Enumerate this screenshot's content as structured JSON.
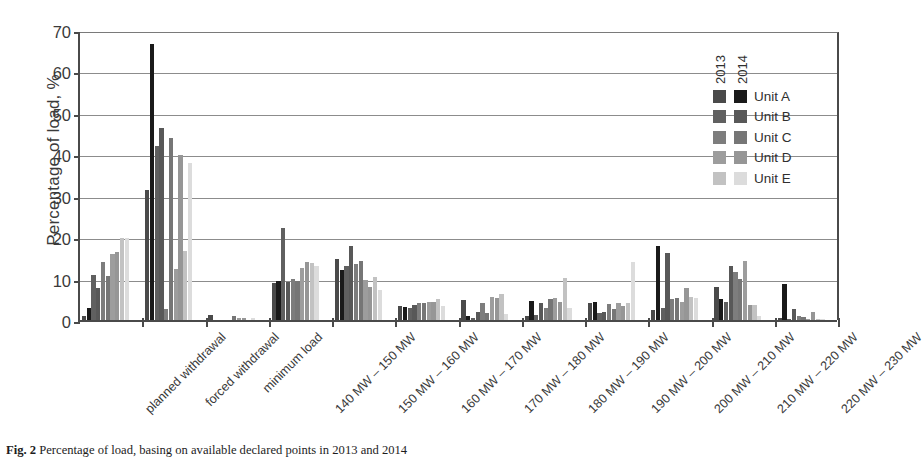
{
  "chart_data": {
    "type": "bar",
    "title": "",
    "xlabel": "",
    "ylabel": "Percentage of load, %",
    "ylim": [
      0,
      70
    ],
    "yticks": [
      0,
      10,
      20,
      30,
      40,
      50,
      60,
      70
    ],
    "grid": true,
    "legend_position": "top-right",
    "legend_groups": [
      "2013",
      "2014"
    ],
    "categories": [
      "planned withdrawal",
      "forced withdrawal",
      "minimum load",
      "140 MW – 150 MW",
      "150 MW – 160 MW",
      "160 MW – 170 MW",
      "170 MW – 180 MW",
      "180 MW – 190 MW",
      "190 MW – 200 MW",
      "200 MW – 210 MW",
      "210 MW – 220 MW",
      "220 MW – 230 MW"
    ],
    "series": [
      {
        "name": "Unit A",
        "year": "2013",
        "color": "#4a4a4a",
        "values": [
          1.0,
          31.5,
          1.1,
          9.0,
          14.8,
          3.5,
          4.8,
          1.0,
          4.2,
          2.3,
          7.9,
          0.4
        ]
      },
      {
        "name": "Unit A",
        "year": "2014",
        "color": "#1a1a1a",
        "values": [
          2.8,
          66.7,
          0.0,
          9.3,
          12.0,
          3.2,
          0.9,
          4.5,
          4.4,
          17.9,
          5.1,
          8.7
        ]
      },
      {
        "name": "Unit B",
        "year": "2013",
        "color": "#606060",
        "values": [
          10.9,
          41.9,
          0.0,
          22.2,
          13.0,
          3.0,
          0.5,
          1.3,
          1.7,
          2.8,
          4.3,
          0.3
        ]
      },
      {
        "name": "Unit B",
        "year": "2014",
        "color": "#585858",
        "values": [
          7.7,
          46.3,
          0.0,
          9.2,
          17.9,
          3.6,
          1.9,
          4.2,
          2.0,
          16.1,
          13.1,
          2.6
        ]
      },
      {
        "name": "Unit C",
        "year": "2013",
        "color": "#7d7d7d",
        "values": [
          13.9,
          2.6,
          0.0,
          9.8,
          13.5,
          4.0,
          4.0,
          3.0,
          3.9,
          5.0,
          11.6,
          1.0
        ]
      },
      {
        "name": "Unit C",
        "year": "2014",
        "color": "#767676",
        "values": [
          10.7,
          43.9,
          0.9,
          9.4,
          14.2,
          4.1,
          1.6,
          5.0,
          2.6,
          5.2,
          9.8,
          0.8
        ]
      },
      {
        "name": "Unit D",
        "year": "2013",
        "color": "#9d9d9d",
        "values": [
          16.0,
          12.3,
          0.6,
          12.5,
          9.6,
          4.4,
          5.5,
          5.3,
          4.0,
          4.3,
          14.3,
          0.3
        ]
      },
      {
        "name": "Unit D",
        "year": "2014",
        "color": "#969696",
        "values": [
          16.5,
          39.8,
          0.5,
          14.1,
          8.0,
          4.3,
          5.2,
          4.3,
          3.5,
          7.8,
          3.7,
          2.0
        ]
      },
      {
        "name": "Unit E",
        "year": "2013",
        "color": "#c2c2c2",
        "values": [
          19.8,
          16.6,
          0.0,
          13.8,
          10.3,
          5.1,
          6.2,
          10.1,
          4.1,
          5.6,
          3.7,
          0.2
        ]
      },
      {
        "name": "Unit E",
        "year": "2014",
        "color": "#dcdcdc",
        "values": [
          19.9,
          37.9,
          0.5,
          13.1,
          7.2,
          3.5,
          1.4,
          3.0,
          14.1,
          5.4,
          1.0,
          0.2
        ]
      }
    ]
  },
  "legend": {
    "years": [
      "2013",
      "2014"
    ],
    "units": [
      {
        "label": "Unit A",
        "c2013": "#4a4a4a",
        "c2014": "#1a1a1a"
      },
      {
        "label": "Unit B",
        "c2013": "#606060",
        "c2014": "#585858"
      },
      {
        "label": "Unit C",
        "c2013": "#7d7d7d",
        "c2014": "#767676"
      },
      {
        "label": "Unit D",
        "c2013": "#9d9d9d",
        "c2014": "#969696"
      },
      {
        "label": "Unit E",
        "c2013": "#c2c2c2",
        "c2014": "#dcdcdc"
      }
    ]
  },
  "caption": {
    "figure_number": "Fig. 2",
    "text": "Percentage of load, basing on available declared points in 2013 and 2014"
  }
}
